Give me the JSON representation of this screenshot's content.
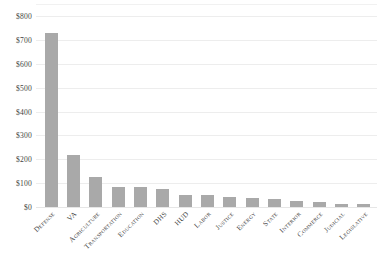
{
  "chart_data": {
    "type": "bar",
    "title": "",
    "subtitle": "",
    "xlabel": "",
    "ylabel": "",
    "ylim": [
      0,
      800
    ],
    "ytick_step": 100,
    "ytick_labels": [
      "$800",
      "$700",
      "$600",
      "$500",
      "$400",
      "$300",
      "$200",
      "$100",
      "$0"
    ],
    "ytick_values": [
      800,
      700,
      600,
      500,
      400,
      300,
      200,
      100,
      0
    ],
    "grid": true,
    "legend": "none",
    "bar_color": "#a9a9a9",
    "gridline_color": "#ededed",
    "categories": [
      "Defense",
      "VA",
      "Agriculture",
      "Transportation",
      "Education",
      "DHS",
      "HUD",
      "Labor",
      "Justice",
      "Energy",
      "State",
      "Interior",
      "Commerce",
      "Judicial",
      "Legislative"
    ],
    "values": [
      730,
      218,
      125,
      84,
      84,
      75,
      50,
      52,
      40,
      36,
      33,
      25,
      23,
      13,
      12
    ]
  }
}
